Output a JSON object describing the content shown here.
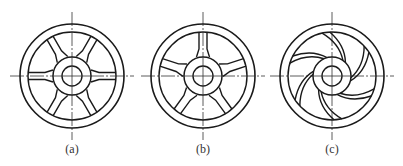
{
  "figure": {
    "stroke_color": "#1a1a1a",
    "centerline_color": "#333333",
    "panels": [
      {
        "id": "a",
        "label": "(a)",
        "cx": 72,
        "cy": 76,
        "spoke_style": "straight-6"
      },
      {
        "id": "b",
        "label": "(b)",
        "cx": 203,
        "cy": 76,
        "spoke_style": "straight-5"
      },
      {
        "id": "c",
        "label": "(c)",
        "cx": 332,
        "cy": 76,
        "spoke_style": "curved-6"
      }
    ],
    "geometry": {
      "outer_r": 52,
      "rim_inner_r": 44,
      "hub_r": 19,
      "bore_r": 10
    }
  }
}
